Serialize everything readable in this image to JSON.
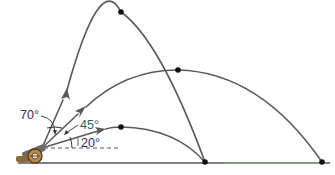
{
  "figure": {
    "angles": [
      {
        "label": "70°",
        "color": "#333333"
      },
      {
        "label": "45°",
        "color": "#1f6b4a"
      },
      {
        "label": "20°",
        "color": "#2a2a7a"
      }
    ],
    "colors": {
      "trajectory": "#5a5a5a",
      "apex_dot": "#111111",
      "ground": "#555555",
      "ground_highlight": "#7bd67b",
      "horizontal_reference": "#3a3a8a"
    }
  }
}
